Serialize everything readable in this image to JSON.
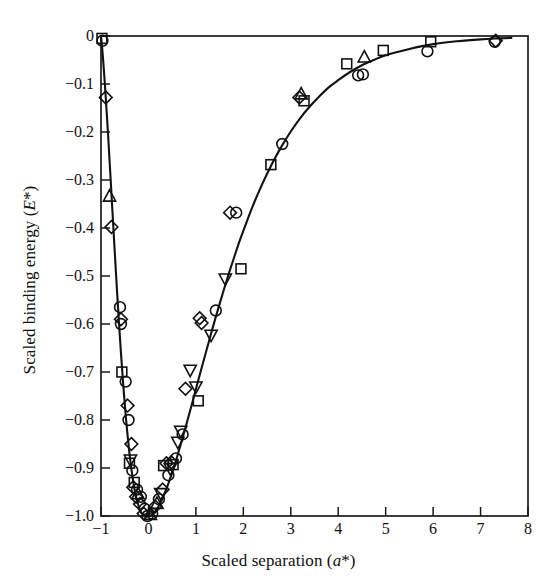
{
  "chart_data": {
    "type": "line",
    "title": "",
    "subtitle": "",
    "xlabel": "Scaled separation (a*)",
    "ylabel": "Scaled binding energy (E*)",
    "xlim": [
      -1,
      8
    ],
    "ylim": [
      -1.0,
      0
    ],
    "grid": false,
    "legend": "none",
    "x_ticks": [
      -1,
      0,
      1,
      2,
      3,
      4,
      5,
      6,
      7,
      8
    ],
    "x_tick_labels": [
      "−1",
      "0",
      "1",
      "2",
      "3",
      "4",
      "5",
      "6",
      "7",
      "8"
    ],
    "y_ticks": [
      0,
      -0.1,
      -0.2,
      -0.3,
      -0.4,
      -0.5,
      -0.6,
      -0.7,
      -0.8,
      -0.9,
      -1.0
    ],
    "y_tick_labels": [
      "0",
      "−0.1",
      "−0.2",
      "−0.3",
      "−0.4",
      "−0.5",
      "−0.6",
      "−0.7",
      "−0.8",
      "−0.9",
      "−1.0"
    ],
    "curve_name": "Universal binding energy relation E* = -(1 + a*) exp(-a*)",
    "curve": [
      [
        -1.0,
        0.0
      ],
      [
        -0.98,
        -0.02
      ],
      [
        -0.96,
        -0.044
      ],
      [
        -0.94,
        -0.07
      ],
      [
        -0.92,
        -0.098
      ],
      [
        -0.9,
        -0.128
      ],
      [
        -0.88,
        -0.159
      ],
      [
        -0.86,
        -0.191
      ],
      [
        -0.84,
        -0.224
      ],
      [
        -0.82,
        -0.258
      ],
      [
        -0.8,
        -0.293
      ],
      [
        -0.78,
        -0.328
      ],
      [
        -0.76,
        -0.363
      ],
      [
        -0.74,
        -0.398
      ],
      [
        -0.72,
        -0.433
      ],
      [
        -0.7,
        -0.467
      ],
      [
        -0.68,
        -0.501
      ],
      [
        -0.66,
        -0.535
      ],
      [
        -0.64,
        -0.567
      ],
      [
        -0.62,
        -0.599
      ],
      [
        -0.6,
        -0.629
      ],
      [
        -0.58,
        -0.659
      ],
      [
        -0.56,
        -0.687
      ],
      [
        -0.54,
        -0.715
      ],
      [
        -0.52,
        -0.741
      ],
      [
        -0.5,
        -0.765
      ],
      [
        -0.48,
        -0.789
      ],
      [
        -0.46,
        -0.811
      ],
      [
        -0.44,
        -0.832
      ],
      [
        -0.42,
        -0.851
      ],
      [
        -0.4,
        -0.87
      ],
      [
        -0.38,
        -0.886
      ],
      [
        -0.36,
        -0.902
      ],
      [
        -0.34,
        -0.916
      ],
      [
        -0.32,
        -0.929
      ],
      [
        -0.3,
        -0.941
      ],
      [
        -0.28,
        -0.951
      ],
      [
        -0.26,
        -0.96
      ],
      [
        -0.24,
        -0.968
      ],
      [
        -0.22,
        -0.975
      ],
      [
        -0.2,
        -0.982
      ],
      [
        -0.18,
        -0.987
      ],
      [
        -0.16,
        -0.991
      ],
      [
        -0.14,
        -0.994
      ],
      [
        -0.12,
        -0.996
      ],
      [
        -0.1,
        -0.998
      ],
      [
        -0.08,
        -0.999
      ],
      [
        -0.06,
        -1.0
      ],
      [
        -0.04,
        -1.0
      ],
      [
        -0.02,
        -1.0
      ],
      [
        0.0,
        -1.0
      ],
      [
        0.05,
        -0.999
      ],
      [
        0.1,
        -0.995
      ],
      [
        0.15,
        -0.99
      ],
      [
        0.2,
        -0.982
      ],
      [
        0.25,
        -0.973
      ],
      [
        0.3,
        -0.963
      ],
      [
        0.35,
        -0.951
      ],
      [
        0.4,
        -0.938
      ],
      [
        0.45,
        -0.924
      ],
      [
        0.5,
        -0.91
      ],
      [
        0.6,
        -0.878
      ],
      [
        0.7,
        -0.844
      ],
      [
        0.8,
        -0.809
      ],
      [
        0.9,
        -0.773
      ],
      [
        1.0,
        -0.736
      ],
      [
        1.1,
        -0.699
      ],
      [
        1.2,
        -0.663
      ],
      [
        1.3,
        -0.627
      ],
      [
        1.4,
        -0.592
      ],
      [
        1.5,
        -0.558
      ],
      [
        1.6,
        -0.525
      ],
      [
        1.7,
        -0.493
      ],
      [
        1.8,
        -0.463
      ],
      [
        1.9,
        -0.433
      ],
      [
        2.0,
        -0.406
      ],
      [
        2.2,
        -0.354
      ],
      [
        2.4,
        -0.308
      ],
      [
        2.6,
        -0.267
      ],
      [
        2.8,
        -0.231
      ],
      [
        3.0,
        -0.199
      ],
      [
        3.2,
        -0.171
      ],
      [
        3.4,
        -0.147
      ],
      [
        3.6,
        -0.126
      ],
      [
        3.8,
        -0.107
      ],
      [
        4.0,
        -0.092
      ],
      [
        4.25,
        -0.075
      ],
      [
        4.5,
        -0.061
      ],
      [
        4.75,
        -0.05
      ],
      [
        5.0,
        -0.04
      ],
      [
        5.5,
        -0.027
      ],
      [
        6.0,
        -0.017
      ],
      [
        6.5,
        -0.011
      ],
      [
        7.0,
        -0.007
      ],
      [
        7.4,
        -0.005
      ],
      [
        7.65,
        -0.004
      ]
    ],
    "series": [
      {
        "name": "circle-markers",
        "marker": "circle",
        "points": [
          [
            -0.97,
            -0.01
          ],
          [
            -0.6,
            -0.565
          ],
          [
            -0.58,
            -0.6
          ],
          [
            -0.48,
            -0.72
          ],
          [
            -0.42,
            -0.8
          ],
          [
            -0.34,
            -0.905
          ],
          [
            -0.24,
            -0.945
          ],
          [
            -0.16,
            -0.96
          ],
          [
            -0.08,
            -0.985
          ],
          [
            -0.02,
            -1.0
          ],
          [
            0.08,
            -0.995
          ],
          [
            0.22,
            -0.965
          ],
          [
            0.42,
            -0.915
          ],
          [
            0.58,
            -0.88
          ],
          [
            0.72,
            -0.83
          ],
          [
            1.42,
            -0.572
          ],
          [
            1.85,
            -0.368
          ],
          [
            2.82,
            -0.225
          ],
          [
            4.42,
            -0.082
          ],
          [
            4.52,
            -0.08
          ],
          [
            5.88,
            -0.032
          ],
          [
            7.3,
            -0.012
          ]
        ]
      },
      {
        "name": "square-markers",
        "marker": "square",
        "points": [
          [
            -0.98,
            -0.005
          ],
          [
            -0.56,
            -0.7
          ],
          [
            -0.4,
            -0.89
          ],
          [
            -0.3,
            -0.93
          ],
          [
            0.32,
            -0.895
          ],
          [
            1.05,
            -0.76
          ],
          [
            1.95,
            -0.485
          ],
          [
            2.58,
            -0.268
          ],
          [
            3.28,
            -0.135
          ],
          [
            4.18,
            -0.058
          ],
          [
            4.95,
            -0.03
          ],
          [
            5.95,
            -0.012
          ],
          [
            0.52,
            -0.893
          ]
        ]
      },
      {
        "name": "diamond-markers",
        "marker": "diamond",
        "points": [
          [
            -0.9,
            -0.128
          ],
          [
            -0.78,
            -0.398
          ],
          [
            -0.58,
            -0.59
          ],
          [
            -0.44,
            -0.77
          ],
          [
            -0.36,
            -0.85
          ],
          [
            -0.32,
            -0.94
          ],
          [
            -0.26,
            -0.96
          ],
          [
            -0.18,
            -0.975
          ],
          [
            -0.1,
            -0.995
          ],
          [
            0.14,
            -0.98
          ],
          [
            0.3,
            -0.945
          ],
          [
            0.38,
            -0.89
          ],
          [
            0.48,
            -0.888
          ],
          [
            0.78,
            -0.735
          ],
          [
            1.08,
            -0.588
          ],
          [
            1.12,
            -0.598
          ],
          [
            1.72,
            -0.368
          ],
          [
            3.18,
            -0.128
          ],
          [
            7.32,
            -0.01
          ]
        ]
      },
      {
        "name": "triangle-up-markers",
        "marker": "triangle-up",
        "points": [
          [
            -0.82,
            -0.335
          ],
          [
            -0.22,
            -0.955
          ],
          [
            0.04,
            -0.998
          ],
          [
            0.18,
            -0.975
          ],
          [
            3.22,
            -0.122
          ],
          [
            4.55,
            -0.045
          ]
        ]
      },
      {
        "name": "triangle-down-markers",
        "marker": "triangle-down",
        "points": [
          [
            -0.38,
            -0.882
          ],
          [
            0.26,
            -0.952
          ],
          [
            0.46,
            -0.9
          ],
          [
            0.62,
            -0.845
          ],
          [
            0.88,
            -0.695
          ],
          [
            1.0,
            -0.73
          ],
          [
            1.32,
            -0.622
          ],
          [
            1.62,
            -0.505
          ],
          [
            0.68,
            -0.822
          ]
        ]
      }
    ]
  },
  "axes": {
    "x_title": "Scaled separation (a*)",
    "x_title_plain": "Scaled separation (",
    "x_title_italic": "a",
    "x_title_tail": "*)",
    "y_title_plain": "Scaled binding energy (",
    "y_title_italic": "E",
    "y_title_tail": "*)"
  },
  "style": {
    "curve_color": "#121212",
    "axis_color": "#1a1a1a",
    "marker_color": "#111111",
    "background": "#ffffff"
  }
}
